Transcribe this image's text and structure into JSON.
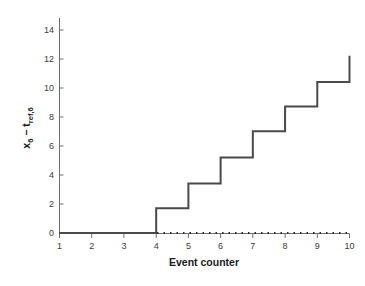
{
  "chart_data": {
    "type": "line",
    "title": "",
    "xlabel": "Event counter",
    "ylabel": "x_6 - t_ref,6",
    "ylabel_parts": {
      "var_base": "x",
      "var_sub": "6",
      "minus": "−",
      "ref_base": "t",
      "ref_sub": "ref,6"
    },
    "xlim": [
      1,
      10
    ],
    "ylim": [
      0,
      14.8
    ],
    "xticks": [
      1,
      2,
      3,
      4,
      5,
      6,
      7,
      8,
      9,
      10
    ],
    "xticklabels": [
      "1",
      "2",
      "3",
      "4",
      "5",
      "6",
      "7",
      "8",
      "9",
      "10"
    ],
    "yticks": [
      0,
      2,
      4,
      6,
      8,
      10,
      12,
      14
    ],
    "yticklabels": [
      "0",
      "2",
      "4",
      "6",
      "8",
      "10",
      "12",
      "14"
    ],
    "grid": false,
    "legend": false,
    "legend_position": "none",
    "x": [
      1,
      2,
      3,
      4,
      5,
      6,
      7,
      8,
      9,
      10
    ],
    "series": [
      {
        "name": "step-series",
        "style": "step-post",
        "linestyle": "solid",
        "color": "#4a4a4a",
        "linewidth": 2,
        "values": [
          0,
          0,
          0,
          1.7,
          3.4,
          5.2,
          7.0,
          8.7,
          10.4,
          12.2
        ]
      },
      {
        "name": "zero-reference",
        "style": "line",
        "linestyle": "dotted",
        "color": "#2b2b2b",
        "linewidth": 2,
        "values": [
          0,
          0,
          0,
          0,
          0,
          0,
          0,
          0,
          0,
          0
        ]
      }
    ],
    "annotations": []
  },
  "figure": {
    "background": "#ffffff",
    "axis_color": "#6e6e6e",
    "tick_color": "#6e6e6e",
    "text_color": "#1a1a1a"
  }
}
